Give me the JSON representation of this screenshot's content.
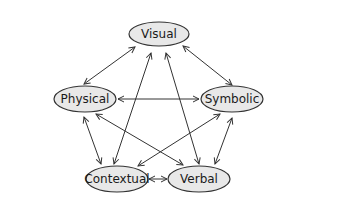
{
  "diagram": {
    "background": "#ffffff",
    "node_fill": "#e8e8e8",
    "node_stroke": "#333333",
    "edge_color": "#333333",
    "text_color": "#1a1a1a",
    "nodes": [
      {
        "id": "visual",
        "label": "Visual",
        "cx": 159,
        "cy": 34,
        "rx": 30,
        "ry": 12
      },
      {
        "id": "physical",
        "label": "Physical",
        "cx": 85,
        "cy": 99,
        "rx": 31,
        "ry": 13
      },
      {
        "id": "symbolic",
        "label": "Symbolic",
        "cx": 232,
        "cy": 99,
        "rx": 31,
        "ry": 13
      },
      {
        "id": "contextual",
        "label": "Contextual",
        "cx": 117,
        "cy": 179,
        "rx": 31,
        "ry": 13
      },
      {
        "id": "verbal",
        "label": "Verbal",
        "cx": 199,
        "cy": 179,
        "rx": 31,
        "ry": 13
      }
    ],
    "edges": [
      {
        "from": "visual",
        "to": "physical",
        "x1": 135,
        "y1": 47,
        "x2": 84,
        "y2": 84,
        "bidirectional": true
      },
      {
        "from": "visual",
        "to": "symbolic",
        "x1": 183,
        "y1": 46,
        "x2": 232,
        "y2": 85,
        "bidirectional": true
      },
      {
        "from": "visual",
        "to": "contextual",
        "x1": 151,
        "y1": 53,
        "x2": 114,
        "y2": 164,
        "bidirectional": true
      },
      {
        "from": "visual",
        "to": "verbal",
        "x1": 166,
        "y1": 53,
        "x2": 199,
        "y2": 164,
        "bidirectional": true
      },
      {
        "from": "physical",
        "to": "symbolic",
        "x1": 118,
        "y1": 99,
        "x2": 199,
        "y2": 99,
        "bidirectional": true
      },
      {
        "from": "physical",
        "to": "contextual",
        "x1": 84,
        "y1": 117,
        "x2": 101,
        "y2": 164,
        "bidirectional": true
      },
      {
        "from": "physical",
        "to": "verbal",
        "x1": 96,
        "y1": 114,
        "x2": 183,
        "y2": 165,
        "bidirectional": true
      },
      {
        "from": "symbolic",
        "to": "contextual",
        "x1": 220,
        "y1": 114,
        "x2": 138,
        "y2": 166,
        "bidirectional": true
      },
      {
        "from": "symbolic",
        "to": "verbal",
        "x1": 232,
        "y1": 118,
        "x2": 215,
        "y2": 164,
        "bidirectional": true
      },
      {
        "from": "contextual",
        "to": "verbal",
        "x1": 149,
        "y1": 179,
        "x2": 167,
        "y2": 179,
        "bidirectional": true
      }
    ]
  }
}
